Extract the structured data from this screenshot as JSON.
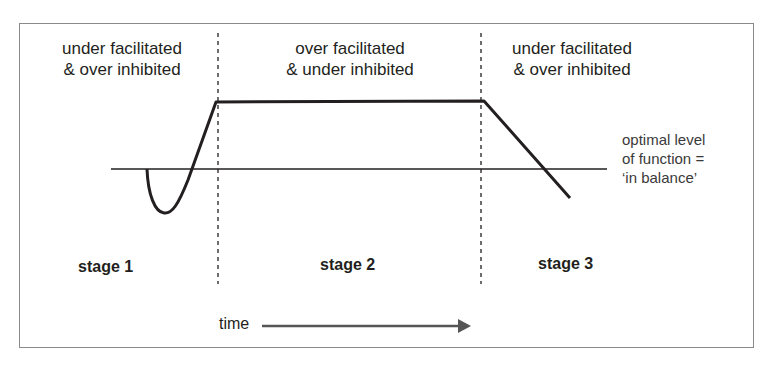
{
  "diagram": {
    "regions": [
      {
        "line1": "under facilitated",
        "line2": "& over inhibited"
      },
      {
        "line1": "over facilitated",
        "line2": "& under inhibited"
      },
      {
        "line1": "under facilitated",
        "line2": "& over inhibited"
      }
    ],
    "stages": [
      "stage 1",
      "stage 2",
      "stage 3"
    ],
    "optimal_label": {
      "line1": "optimal level",
      "line2": "of function =",
      "line3": "‘in balance’"
    },
    "time_label": "time",
    "colors": {
      "line": "#231f20",
      "frame": "#8a8a8a",
      "arrow": "#555555"
    }
  }
}
